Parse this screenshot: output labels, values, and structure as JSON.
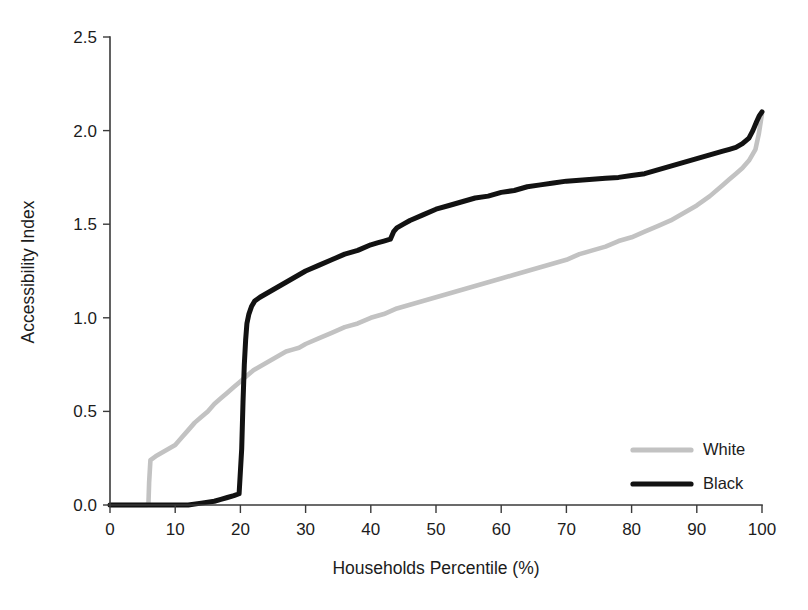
{
  "chart_data": {
    "type": "line",
    "title": "",
    "xlabel": "Households Percentile (%)",
    "ylabel": "Accessibility Index",
    "xlim": [
      0,
      100
    ],
    "ylim": [
      0,
      2.5
    ],
    "xticks": [
      0,
      10,
      20,
      30,
      40,
      50,
      60,
      70,
      80,
      90,
      100
    ],
    "xtick_labels": [
      "0",
      "10",
      "20",
      "30",
      "40",
      "50",
      "60",
      "70",
      "80",
      "90",
      "100"
    ],
    "yticks": [
      0.0,
      0.5,
      1.0,
      1.5,
      2.0,
      2.5
    ],
    "ytick_labels": [
      "0.0",
      "0.5",
      "1.0",
      "1.5",
      "2.0",
      "2.5"
    ],
    "grid": false,
    "legend_position": "lower-right",
    "series": [
      {
        "name": "White",
        "color": "#c2c2c2",
        "linewidth": 4.6,
        "x": [
          0,
          2,
          4,
          5.6,
          5.9,
          6.0,
          6.2,
          7,
          8,
          9,
          10,
          11,
          12,
          13,
          14,
          15,
          16,
          17,
          18,
          19,
          20,
          21,
          22,
          23,
          24,
          25,
          26,
          27,
          28,
          29,
          30,
          32,
          34,
          36,
          38,
          40,
          42,
          44,
          46,
          48,
          50,
          52,
          54,
          56,
          58,
          60,
          62,
          64,
          66,
          68,
          70,
          72,
          74,
          76,
          78,
          80,
          82,
          84,
          86,
          88,
          90,
          92,
          94,
          95,
          96,
          97,
          98,
          99,
          99.5,
          100
        ],
        "y": [
          0.0,
          0.0,
          0.0,
          0.0,
          0.01,
          0.12,
          0.24,
          0.26,
          0.28,
          0.3,
          0.32,
          0.36,
          0.4,
          0.44,
          0.47,
          0.5,
          0.54,
          0.57,
          0.6,
          0.63,
          0.66,
          0.69,
          0.72,
          0.74,
          0.76,
          0.78,
          0.8,
          0.82,
          0.83,
          0.84,
          0.86,
          0.89,
          0.92,
          0.95,
          0.97,
          1.0,
          1.02,
          1.05,
          1.07,
          1.09,
          1.11,
          1.13,
          1.15,
          1.17,
          1.19,
          1.21,
          1.23,
          1.25,
          1.27,
          1.29,
          1.31,
          1.34,
          1.36,
          1.38,
          1.41,
          1.43,
          1.46,
          1.49,
          1.52,
          1.56,
          1.6,
          1.65,
          1.71,
          1.74,
          1.77,
          1.8,
          1.84,
          1.9,
          1.98,
          2.09
        ]
      },
      {
        "name": "Black",
        "color": "#121212",
        "linewidth": 5.0,
        "x": [
          0,
          3,
          6,
          9,
          12,
          14,
          16,
          17,
          18,
          19,
          19.8,
          20.2,
          20.4,
          20.6,
          20.8,
          21.0,
          21.3,
          21.7,
          22.2,
          23,
          24,
          25,
          26,
          27,
          28,
          29,
          30,
          32,
          34,
          36,
          38,
          40,
          41,
          42,
          43,
          43.5,
          44,
          45,
          46,
          48,
          50,
          52,
          54,
          56,
          58,
          60,
          62,
          64,
          66,
          68,
          70,
          72,
          74,
          76,
          78,
          80,
          82,
          84,
          86,
          88,
          90,
          92,
          94,
          95,
          96,
          97,
          98,
          98.6,
          99.2,
          99.6,
          100
        ],
        "y": [
          0.0,
          0.0,
          0.0,
          0.0,
          0.0,
          0.01,
          0.02,
          0.03,
          0.04,
          0.05,
          0.06,
          0.3,
          0.55,
          0.75,
          0.88,
          0.97,
          1.02,
          1.06,
          1.09,
          1.11,
          1.13,
          1.15,
          1.17,
          1.19,
          1.21,
          1.23,
          1.25,
          1.28,
          1.31,
          1.34,
          1.36,
          1.39,
          1.4,
          1.41,
          1.42,
          1.46,
          1.48,
          1.5,
          1.52,
          1.55,
          1.58,
          1.6,
          1.62,
          1.64,
          1.65,
          1.67,
          1.68,
          1.7,
          1.71,
          1.72,
          1.73,
          1.735,
          1.74,
          1.745,
          1.75,
          1.76,
          1.77,
          1.79,
          1.81,
          1.83,
          1.85,
          1.87,
          1.89,
          1.9,
          1.91,
          1.93,
          1.96,
          2.0,
          2.05,
          2.08,
          2.1
        ]
      }
    ]
  },
  "legend": {
    "items": [
      {
        "label": "White",
        "color": "#c2c2c2"
      },
      {
        "label": "Black",
        "color": "#121212"
      }
    ]
  }
}
